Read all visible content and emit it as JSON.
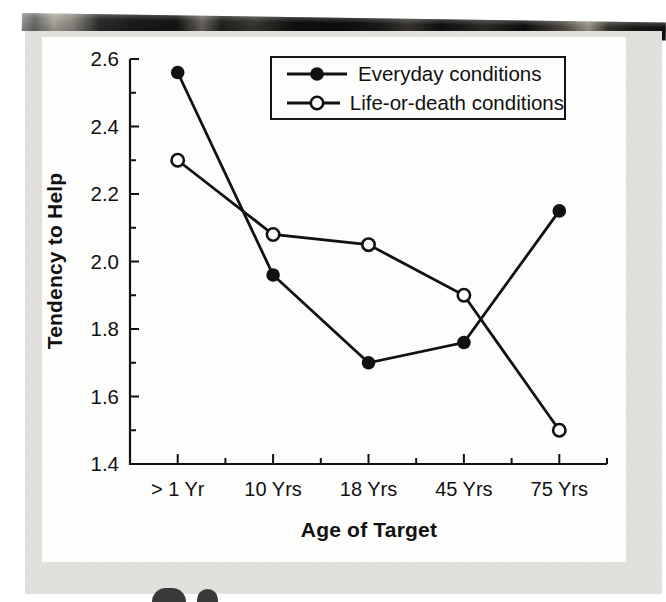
{
  "page": {
    "background_color": "#e3e2df",
    "panel_color": "#fdfdfc",
    "ink_color": "#111111"
  },
  "chart_data": {
    "type": "line",
    "title": "",
    "xlabel": "Age of Target",
    "ylabel": "Tendency to Help",
    "categories": [
      "> 1 Yr",
      "10 Yrs",
      "18 Yrs",
      "45 Yrs",
      "75 Yrs"
    ],
    "series": [
      {
        "name": "Everyday conditions",
        "marker": "filled-circle",
        "values": [
          2.56,
          1.96,
          1.7,
          1.76,
          2.15
        ]
      },
      {
        "name": "Life-or-death conditions",
        "marker": "open-circle",
        "values": [
          2.3,
          2.08,
          2.05,
          1.9,
          1.5
        ]
      }
    ],
    "ylim": [
      1.4,
      2.6
    ],
    "y_major_ticks": [
      1.4,
      1.6,
      1.8,
      2.0,
      2.2,
      2.4,
      2.6
    ],
    "y_minor_step": 0.1,
    "grid": false,
    "legend_position": "top-right"
  }
}
